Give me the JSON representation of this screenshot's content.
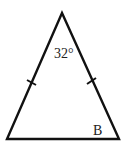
{
  "diagram": {
    "type": "isosceles-triangle",
    "apex_angle_label": "32°",
    "base_angle_label": "B",
    "congruent_sides_marked": true,
    "stroke_color": "#111111"
  }
}
